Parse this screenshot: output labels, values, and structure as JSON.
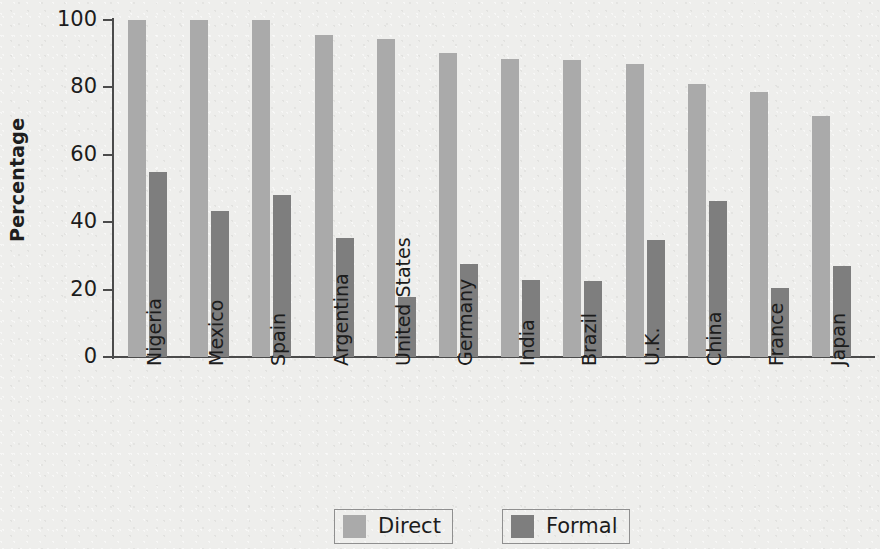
{
  "chart_data": {
    "type": "bar",
    "title": "",
    "xlabel": "",
    "ylabel": "Percentage",
    "ylim": [
      0,
      100
    ],
    "yticks": [
      0,
      20,
      40,
      60,
      80,
      100
    ],
    "ytick_labels": [
      "0",
      "20",
      "40",
      "60",
      "80",
      "100"
    ],
    "grid": false,
    "legend_position": "bottom-center",
    "categories": [
      "Nigeria",
      "Mexico",
      "Spain",
      "Argentina",
      "United States",
      "Germany",
      "India",
      "Brazil",
      "U.K.",
      "China",
      "France",
      "Japan"
    ],
    "series": [
      {
        "name": "Direct",
        "color": "#aaaaaa",
        "values": [
          100,
          100,
          100,
          95.5,
          94.3,
          90.2,
          88.4,
          88.0,
          87.0,
          81.0,
          78.5,
          71.5
        ]
      },
      {
        "name": "Formal",
        "color": "#7e7e7e",
        "values": [
          54.8,
          43.4,
          48.2,
          35.3,
          17.8,
          27.5,
          22.9,
          22.6,
          34.7,
          46.4,
          20.4,
          27.0
        ]
      }
    ]
  },
  "legend": {
    "items": [
      {
        "label": "Direct",
        "color": "#aaaaaa"
      },
      {
        "label": "Formal",
        "color": "#7e7e7e"
      }
    ]
  },
  "axes": {
    "y_title": "Percentage"
  }
}
